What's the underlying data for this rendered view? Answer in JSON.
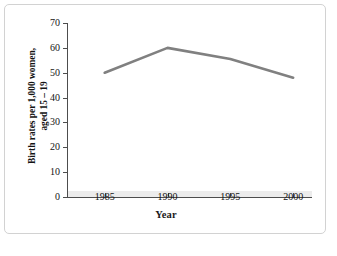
{
  "figure": {
    "background_color": "#ffffff",
    "panel_border_color": "#d2d2d2",
    "caption_fragment": ""
  },
  "chart_data": {
    "type": "line",
    "title": "",
    "xlabel": "Year",
    "ylabel": "Birth rates per 1,000 women, aged 15 – 19",
    "ylabel_line1": "Birth rates per 1,000 women,",
    "ylabel_line2": "aged 15 – 19",
    "x": [
      1985,
      1990,
      1995,
      2000
    ],
    "values": [
      50,
      60,
      55.5,
      48
    ],
    "categories": [
      "1985",
      "1990",
      "1995",
      "2000"
    ],
    "xtick_labels": [
      "1985",
      "1990",
      "1995",
      "2000"
    ],
    "ytick_labels": [
      "0",
      "10",
      "20",
      "30",
      "40",
      "50",
      "60",
      "70"
    ],
    "ytick_values": [
      0,
      10,
      20,
      30,
      40,
      50,
      60,
      70
    ],
    "xlim": [
      1982,
      2001.5
    ],
    "ylim": [
      0,
      70
    ],
    "grid": false,
    "legend": false,
    "series_color": "#808080",
    "series_width_px": 2.6,
    "axis_color": "#4d4d4d"
  }
}
